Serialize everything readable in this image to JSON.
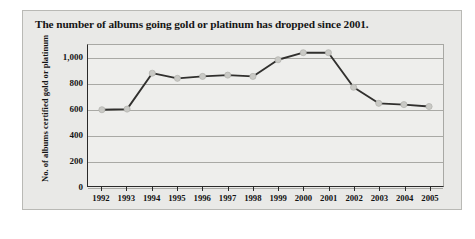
{
  "figure": {
    "title": "The number of albums going gold or platinum has dropped since 2001.",
    "panel_color": "#e9e9e7",
    "plot_color": "#eeeeec",
    "border_color": "#a8a8a4"
  },
  "chart_data": {
    "type": "line",
    "title": "The number of albums going gold or platinum has dropped since 2001.",
    "xlabel": "",
    "ylabel": "No. of albums certified gold or platinum",
    "categories": [
      "1992",
      "1993",
      "1994",
      "1995",
      "1996",
      "1997",
      "1998",
      "1999",
      "2000",
      "2001",
      "2002",
      "2003",
      "2004",
      "2005"
    ],
    "values": [
      595,
      600,
      880,
      840,
      855,
      865,
      855,
      985,
      1040,
      1040,
      770,
      645,
      635,
      620
    ],
    "series": [
      {
        "name": "No. of albums certified gold or platinum",
        "values": [
          595,
          600,
          880,
          840,
          855,
          865,
          855,
          985,
          1040,
          1040,
          770,
          645,
          635,
          620
        ],
        "line_color": "#31302e",
        "marker_color": "#c9c9c5"
      }
    ],
    "ylim": [
      0,
      1100
    ],
    "yticks": [
      0,
      200,
      400,
      600,
      800,
      1000
    ],
    "ytick_labels": [
      "0",
      "200",
      "400",
      "600",
      "800",
      "1,000"
    ],
    "grid": true,
    "legend": false,
    "legend_position": "none"
  }
}
